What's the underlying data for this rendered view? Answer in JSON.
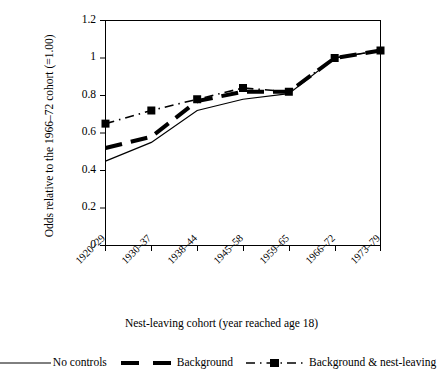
{
  "chart_data": {
    "type": "line",
    "title": "",
    "xlabel": "Nest-leaving cohort (year reached age 18)",
    "ylabel": "Odds relative to the 1966–72 cohort (=1.00)",
    "categories": [
      "1920–29",
      "1930–37",
      "1938–44",
      "1945–58",
      "1959–65",
      "1966–72",
      "1973–79"
    ],
    "ylim": [
      0,
      1.2
    ],
    "yticks": [
      0,
      0.2,
      0.4,
      0.6,
      0.8,
      1,
      1.2
    ],
    "ytick_labels": [
      "0",
      "0.2",
      "0.4",
      "0.6",
      "0.8",
      "1",
      "1.2"
    ],
    "grid": false,
    "legend_position": "bottom",
    "series": [
      {
        "name": "No controls",
        "values": [
          0.45,
          0.55,
          0.72,
          0.78,
          0.81,
          1.0,
          1.04
        ],
        "style": "solid-thin",
        "marker": "none",
        "color": "#000000"
      },
      {
        "name": "Background",
        "values": [
          0.52,
          0.58,
          0.77,
          0.82,
          0.82,
          1.0,
          1.04
        ],
        "style": "dashed-thick",
        "marker": "none",
        "color": "#000000"
      },
      {
        "name": "Background & nest-leaving",
        "values": [
          0.65,
          0.72,
          0.78,
          0.84,
          0.82,
          1.0,
          1.04
        ],
        "style": "dash-dot",
        "marker": "square",
        "color": "#000000"
      }
    ]
  },
  "axes": {
    "y_title": "Odds relative to the 1966–72 cohort (=1.00)",
    "x_title": "Nest-leaving cohort (year reached age 18)",
    "y_ticks": [
      "1.2",
      "1",
      "0.8",
      "0.6",
      "0.4",
      "0.2",
      "0"
    ],
    "x_ticks": [
      "1920–29",
      "1930–37",
      "1938–44",
      "1945–58",
      "1959–65",
      "1966–72",
      "1973–79"
    ]
  },
  "legend": {
    "entries": [
      {
        "label": "No controls",
        "swatch": "thin-solid-line-swatch"
      },
      {
        "label": "Background",
        "swatch": "thick-dashed-line-swatch"
      },
      {
        "label": "Background & nest-leaving",
        "swatch": "dash-dot-square-marker-swatch"
      }
    ]
  }
}
